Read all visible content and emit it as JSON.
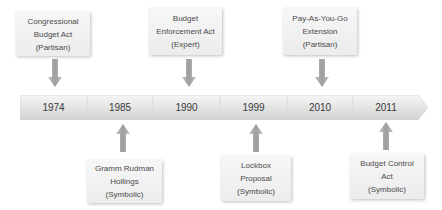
{
  "diagram": {
    "type": "timeline",
    "colors": {
      "bar_fill_top": "#f4f4f4",
      "bar_fill_bottom": "#d4d4d4",
      "box_fill": "#f2f2f2",
      "arrow_fill": "#a8a8a8",
      "text": "#444444"
    },
    "timeline": {
      "years": [
        "1974",
        "1985",
        "1990",
        "1999",
        "2010",
        "2011"
      ]
    },
    "events_above": [
      {
        "year": "1974",
        "lines": [
          "Congressional",
          "Budget Act",
          "(Partisan)"
        ]
      },
      {
        "year": "1990",
        "lines": [
          "Budget",
          "Enforcement Act",
          "(Expert)"
        ]
      },
      {
        "year": "2010",
        "lines": [
          "Pay-As-You-Go",
          "Extension",
          "(Partisan)"
        ]
      }
    ],
    "events_below": [
      {
        "year": "1985",
        "lines": [
          "Gramm Rudman",
          "Hollings",
          "(Symbolic)"
        ]
      },
      {
        "year": "1999",
        "lines": [
          "Lockbox",
          "Proposal",
          "(Symbolic)"
        ]
      },
      {
        "year": "2011",
        "lines": [
          "Budget Control",
          "Act",
          "(Symbolic)"
        ]
      }
    ]
  }
}
